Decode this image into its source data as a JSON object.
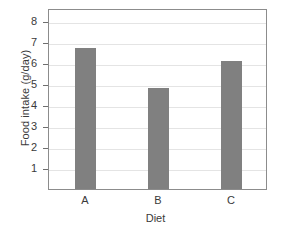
{
  "chart_data": {
    "type": "bar",
    "title": "",
    "categories": [
      "A",
      "B",
      "C"
    ],
    "values": [
      6.7,
      4.8,
      6.1
    ],
    "xlabel": "Diet",
    "ylabel": "Food intake (g/day)",
    "ylim": [
      0,
      8.6
    ],
    "yticks": [
      1,
      2,
      3,
      4,
      5,
      6,
      7,
      8
    ],
    "ytick_labels": [
      "1",
      "2",
      "3",
      "4",
      "5",
      "6",
      "7",
      "8"
    ],
    "xtick_labels": [
      "A",
      "B",
      "C"
    ],
    "grid": "horizontal",
    "legend": "none",
    "bar_color": "#808080",
    "grid_color": "#e4e4e4",
    "frame_color": "#8c8c8c",
    "background_color": "#ffffff",
    "text_color": "#3a3a3a"
  }
}
